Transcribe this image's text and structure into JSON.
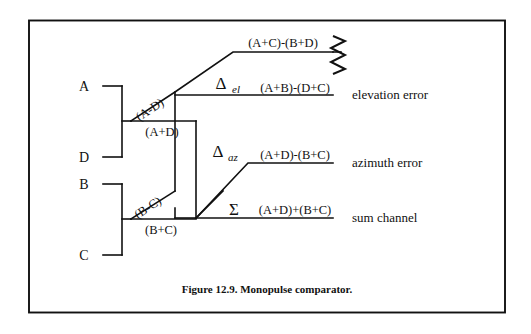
{
  "figure": {
    "caption": "Figure 12.9. Monopulse comparator.",
    "border_color": "#111111",
    "line_color": "#111111",
    "background": "#ffffff"
  },
  "inputs": [
    {
      "label": "A"
    },
    {
      "label": "D"
    },
    {
      "label": "B"
    },
    {
      "label": "C"
    }
  ],
  "internal_signals": [
    {
      "name": "a-minus-d",
      "label": "(A-D)"
    },
    {
      "name": "a-plus-d",
      "label": "(A+D)"
    },
    {
      "name": "b-minus-c",
      "label": "(B-C)"
    },
    {
      "name": "b-plus-c",
      "label": "(B+C)"
    }
  ],
  "outputs": [
    {
      "name": "unused-port",
      "symbol": "",
      "subscript": "",
      "expression": "(A+C)-(B+D)",
      "description": "",
      "termination": "zigzag-resistor"
    },
    {
      "name": "elevation-error",
      "symbol": "Δ",
      "subscript": "el",
      "expression": "(A+B)-(D+C)",
      "description": "elevation error",
      "termination": ""
    },
    {
      "name": "azimuth-error",
      "symbol": "Δ",
      "subscript": "az",
      "expression": "(A+D)-(B+C)",
      "description": "azimuth error",
      "termination": ""
    },
    {
      "name": "sum-channel",
      "symbol": "Σ",
      "subscript": "",
      "expression": "(A+D)+(B+C)",
      "description": "sum channel",
      "termination": ""
    }
  ]
}
